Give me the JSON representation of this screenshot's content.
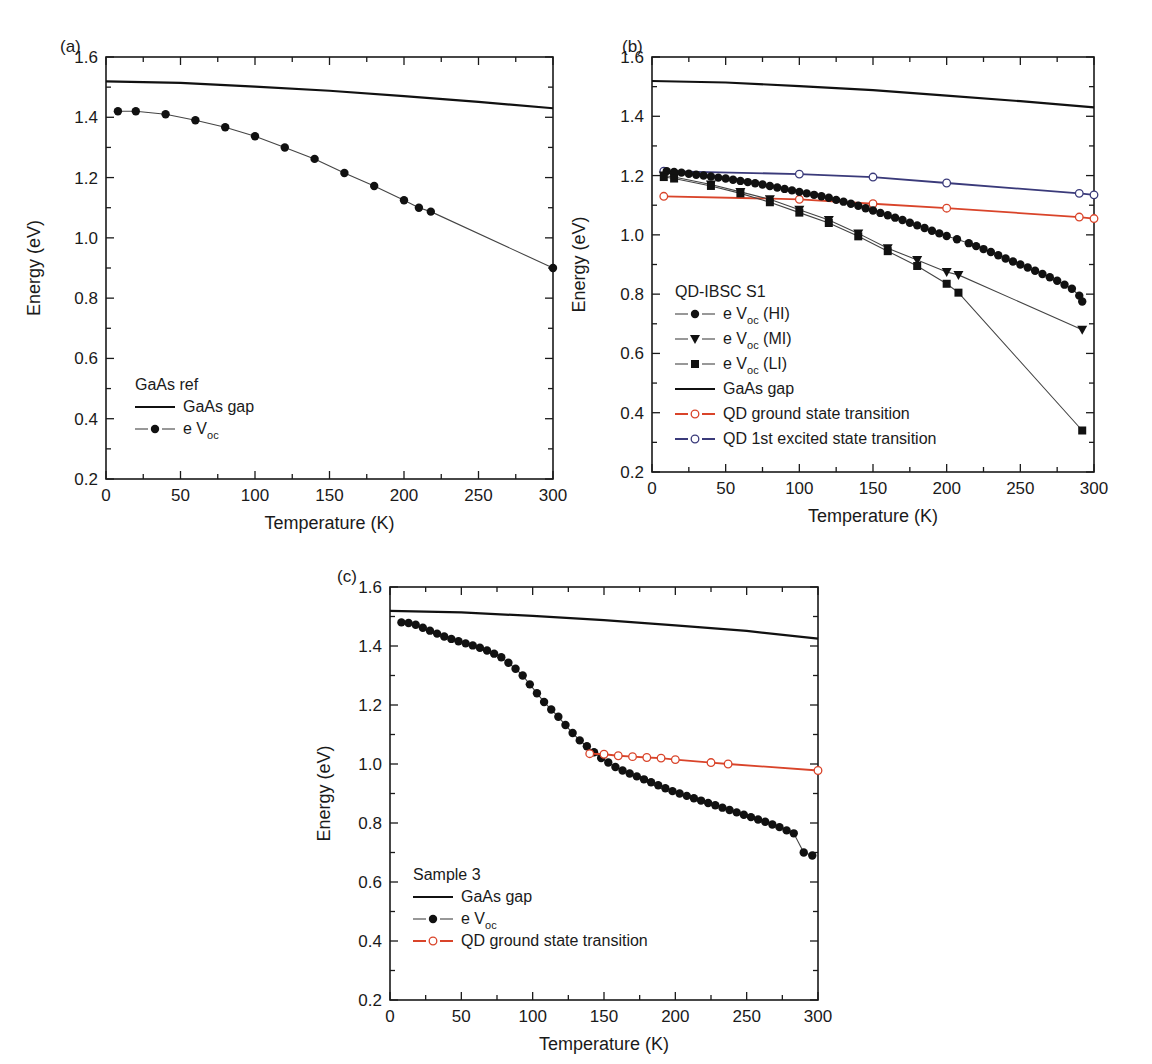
{
  "chart_data": [
    {
      "panel": "(a)",
      "type": "line",
      "xlabel": "Temperature (K)",
      "ylabel": "Energy (eV)",
      "xlim": [
        0,
        300
      ],
      "ylim": [
        0.2,
        1.6
      ],
      "xticks": [
        "0",
        "50",
        "100",
        "150",
        "200",
        "250",
        "300"
      ],
      "yticks": [
        "0.2",
        "0.4",
        "0.6",
        "0.8",
        "1.0",
        "1.2",
        "1.4",
        "1.6"
      ],
      "grid": false,
      "legend": {
        "title": "GaAs ref",
        "position": "lower-left",
        "entries": [
          "GaAs gap",
          "e V_oc"
        ]
      },
      "series": [
        {
          "name": "GaAs gap",
          "style": "solid-line",
          "color": "#111111",
          "x": [
            0,
            50,
            100,
            150,
            200,
            250,
            300
          ],
          "y": [
            1.519,
            1.514,
            1.502,
            1.488,
            1.47,
            1.451,
            1.43
          ]
        },
        {
          "name": "e V_oc",
          "style": "line-filled-circle",
          "color": "#111111",
          "x": [
            8,
            20,
            40,
            60,
            80,
            100,
            120,
            140,
            160,
            180,
            200,
            210,
            218,
            300
          ],
          "y": [
            1.42,
            1.42,
            1.41,
            1.39,
            1.367,
            1.337,
            1.3,
            1.262,
            1.215,
            1.172,
            1.125,
            1.1,
            1.087,
            0.9
          ]
        }
      ]
    },
    {
      "panel": "(b)",
      "type": "line",
      "xlabel": "Temperature (K)",
      "ylabel": "Energy (eV)",
      "xlim": [
        0,
        300
      ],
      "ylim": [
        0.2,
        1.6
      ],
      "xticks": [
        "0",
        "50",
        "100",
        "150",
        "200",
        "250",
        "300"
      ],
      "yticks": [
        "0.2",
        "0.4",
        "0.6",
        "0.8",
        "1.0",
        "1.2",
        "1.4",
        "1.6"
      ],
      "grid": false,
      "legend": {
        "title": "QD-IBSC S1",
        "position": "lower-left",
        "entries": [
          "e V_oc (HI)",
          "e V_oc (MI)",
          "e V_oc (LI)",
          "GaAs gap",
          "QD ground state transition",
          "QD 1st excited state transition"
        ]
      },
      "series": [
        {
          "name": "GaAs gap",
          "style": "solid-line",
          "color": "#111111",
          "x": [
            0,
            50,
            100,
            150,
            200,
            250,
            300
          ],
          "y": [
            1.519,
            1.514,
            1.502,
            1.488,
            1.47,
            1.451,
            1.43
          ]
        },
        {
          "name": "QD 1st excited state transition",
          "style": "line-open-circle",
          "color": "#3a3a7a",
          "x": [
            8,
            100,
            150,
            200,
            290,
            300
          ],
          "y": [
            1.215,
            1.205,
            1.195,
            1.175,
            1.14,
            1.135
          ]
        },
        {
          "name": "QD ground state transition",
          "style": "line-open-circle",
          "color": "#d9442a",
          "x": [
            8,
            100,
            150,
            200,
            290,
            300
          ],
          "y": [
            1.13,
            1.12,
            1.105,
            1.09,
            1.06,
            1.055
          ]
        },
        {
          "name": "e V_oc (HI)",
          "style": "line-filled-circle",
          "color": "#111111",
          "x": [
            10,
            15,
            20,
            25,
            30,
            35,
            40,
            45,
            50,
            55,
            60,
            65,
            70,
            75,
            80,
            85,
            90,
            95,
            100,
            105,
            110,
            115,
            120,
            125,
            130,
            135,
            140,
            145,
            150,
            155,
            160,
            165,
            170,
            175,
            180,
            185,
            190,
            195,
            200,
            207,
            215,
            220,
            225,
            230,
            235,
            240,
            245,
            250,
            255,
            260,
            265,
            270,
            275,
            280,
            285,
            290,
            292
          ],
          "y": [
            1.215,
            1.212,
            1.21,
            1.206,
            1.203,
            1.2,
            1.197,
            1.193,
            1.19,
            1.186,
            1.182,
            1.178,
            1.174,
            1.17,
            1.165,
            1.16,
            1.155,
            1.15,
            1.145,
            1.14,
            1.135,
            1.13,
            1.125,
            1.118,
            1.112,
            1.105,
            1.098,
            1.09,
            1.082,
            1.074,
            1.066,
            1.058,
            1.05,
            1.041,
            1.032,
            1.023,
            1.014,
            1.005,
            0.996,
            0.985,
            0.972,
            0.962,
            0.952,
            0.942,
            0.931,
            0.92,
            0.91,
            0.9,
            0.89,
            0.879,
            0.868,
            0.857,
            0.845,
            0.832,
            0.818,
            0.795,
            0.775
          ]
        },
        {
          "name": "e V_oc (MI)",
          "style": "line-filled-triangle-down",
          "color": "#111111",
          "x": [
            8,
            15,
            40,
            60,
            80,
            100,
            120,
            140,
            160,
            180,
            200,
            208,
            292
          ],
          "y": [
            1.2,
            1.195,
            1.17,
            1.145,
            1.12,
            1.085,
            1.05,
            1.005,
            0.955,
            0.915,
            0.875,
            0.865,
            0.68
          ]
        },
        {
          "name": "e V_oc (LI)",
          "style": "line-filled-square",
          "color": "#111111",
          "x": [
            8,
            15,
            40,
            60,
            80,
            100,
            120,
            140,
            160,
            180,
            200,
            208,
            292
          ],
          "y": [
            1.195,
            1.19,
            1.165,
            1.14,
            1.11,
            1.075,
            1.04,
            0.995,
            0.945,
            0.895,
            0.835,
            0.805,
            0.34
          ]
        }
      ]
    },
    {
      "panel": "(c)",
      "type": "line",
      "xlabel": "Temperature (K)",
      "ylabel": "Energy (eV)",
      "xlim": [
        0,
        300
      ],
      "ylim": [
        0.2,
        1.6
      ],
      "xticks": [
        "0",
        "50",
        "100",
        "150",
        "200",
        "250",
        "300"
      ],
      "yticks": [
        "0.2",
        "0.4",
        "0.6",
        "0.8",
        "1.0",
        "1.2",
        "1.4",
        "1.6"
      ],
      "grid": false,
      "legend": {
        "title": "Sample 3",
        "position": "lower-left",
        "entries": [
          "GaAs gap",
          "e V_oc",
          "QD ground state transition"
        ]
      },
      "series": [
        {
          "name": "GaAs gap",
          "style": "solid-line",
          "color": "#111111",
          "x": [
            0,
            50,
            100,
            150,
            200,
            250,
            300
          ],
          "y": [
            1.519,
            1.514,
            1.502,
            1.488,
            1.47,
            1.451,
            1.425
          ]
        },
        {
          "name": "e V_oc",
          "style": "line-filled-circle",
          "color": "#111111",
          "x": [
            8,
            13,
            18,
            23,
            28,
            33,
            38,
            43,
            48,
            53,
            58,
            63,
            68,
            73,
            78,
            83,
            88,
            93,
            98,
            103,
            108,
            113,
            118,
            123,
            128,
            133,
            138,
            143,
            148,
            153,
            158,
            163,
            168,
            173,
            178,
            183,
            188,
            193,
            198,
            203,
            208,
            213,
            218,
            223,
            228,
            233,
            238,
            243,
            248,
            253,
            258,
            263,
            268,
            273,
            278,
            283,
            290,
            296
          ],
          "y": [
            1.48,
            1.478,
            1.472,
            1.462,
            1.452,
            1.442,
            1.432,
            1.424,
            1.416,
            1.409,
            1.402,
            1.394,
            1.385,
            1.374,
            1.362,
            1.343,
            1.323,
            1.3,
            1.27,
            1.24,
            1.21,
            1.185,
            1.16,
            1.132,
            1.105,
            1.08,
            1.06,
            1.04,
            1.02,
            1.005,
            0.99,
            0.978,
            0.968,
            0.958,
            0.948,
            0.938,
            0.928,
            0.918,
            0.908,
            0.9,
            0.892,
            0.884,
            0.876,
            0.868,
            0.86,
            0.852,
            0.844,
            0.836,
            0.828,
            0.82,
            0.812,
            0.804,
            0.795,
            0.786,
            0.775,
            0.765,
            0.7,
            0.69
          ]
        },
        {
          "name": "QD ground state transition",
          "style": "line-open-circle",
          "color": "#d9442a",
          "x": [
            140,
            150,
            160,
            170,
            180,
            190,
            200,
            225,
            237,
            300
          ],
          "y": [
            1.035,
            1.033,
            1.028,
            1.025,
            1.022,
            1.02,
            1.015,
            1.005,
            1.0,
            0.978
          ]
        }
      ]
    }
  ],
  "panels": {
    "a": {
      "label": "(a)",
      "xlabel": "Temperature (K)",
      "ylabel": "Energy (eV)",
      "legend_title": "GaAs ref",
      "legend": [
        {
          "prefix": "GaAs gap",
          "sub": "",
          "suffix": ""
        },
        {
          "prefix": "e V",
          "sub": "oc",
          "suffix": ""
        }
      ]
    },
    "b": {
      "label": "(b)",
      "xlabel": "Temperature (K)",
      "ylabel": "Energy (eV)",
      "legend_title": "QD-IBSC S1",
      "legend": [
        {
          "prefix": "e V",
          "sub": "oc",
          "suffix": " (HI)"
        },
        {
          "prefix": "e V",
          "sub": "oc",
          "suffix": " (MI)"
        },
        {
          "prefix": "e V",
          "sub": "oc",
          "suffix": " (LI)"
        },
        {
          "prefix": "GaAs gap",
          "sub": "",
          "suffix": ""
        },
        {
          "prefix": "QD ground state transition",
          "sub": "",
          "suffix": ""
        },
        {
          "prefix": "QD 1st excited state transition",
          "sub": "",
          "suffix": ""
        }
      ]
    },
    "c": {
      "label": "(c)",
      "xlabel": "Temperature (K)",
      "ylabel": "Energy (eV)",
      "legend_title": "Sample 3",
      "legend": [
        {
          "prefix": "GaAs gap",
          "sub": "",
          "suffix": ""
        },
        {
          "prefix": "e V",
          "sub": "oc",
          "suffix": ""
        },
        {
          "prefix": "QD ground state transition",
          "sub": "",
          "suffix": ""
        }
      ]
    }
  },
  "colors": {
    "axis": "#1a1a1a",
    "black_series": "#111111",
    "qd_ground": "#d9442a",
    "qd_excited": "#3a3a7a"
  }
}
